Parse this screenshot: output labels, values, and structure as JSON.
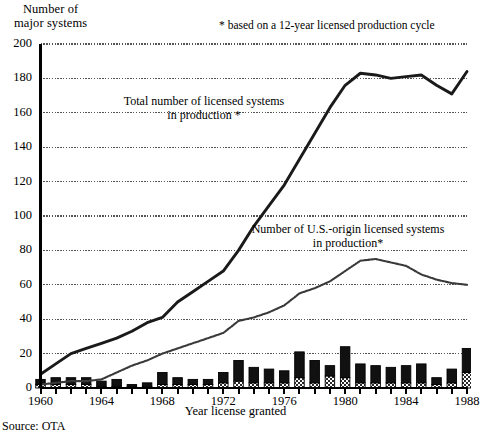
{
  "labels": {
    "y_axis_title": "Number of\nmajor systems",
    "x_axis_title": "Year license granted",
    "footnote": "* based on a 12-year licensed production cycle",
    "source": "Source: OTA",
    "annotation_total": "Total number of licensed systems\nin production *",
    "annotation_us": "Number of U.S.-origin licensed systems\nin production*"
  },
  "colors": {
    "axis": "#000000",
    "gridline": "#555555",
    "line_total": "#1a1a1a",
    "line_us": "#3a3a3a",
    "bar_top": "#111111",
    "bar_bottom_pattern": "#cccccc",
    "background": "#ffffff"
  },
  "chart_data": {
    "type": "line",
    "title": "",
    "xlabel": "Year license granted",
    "ylabel": "Number of major systems",
    "xlim": [
      1960,
      1988
    ],
    "ylim": [
      0,
      200
    ],
    "ytick_labels": [
      "0",
      "20",
      "40",
      "60",
      "80",
      "100",
      "120",
      "140",
      "160",
      "180",
      "200"
    ],
    "yticks": [
      0,
      20,
      40,
      60,
      80,
      100,
      120,
      140,
      160,
      180,
      200
    ],
    "xtick_labels": [
      "1960",
      "1964",
      "1968",
      "1972",
      "1976",
      "1980",
      "1984",
      "1988"
    ],
    "xticks": [
      1960,
      1964,
      1968,
      1972,
      1976,
      1980,
      1984,
      1988
    ],
    "grid": true,
    "legend_position": "inline-annotations",
    "x": [
      1960,
      1961,
      1962,
      1963,
      1964,
      1965,
      1966,
      1967,
      1968,
      1969,
      1970,
      1971,
      1972,
      1973,
      1974,
      1975,
      1976,
      1977,
      1978,
      1979,
      1980,
      1981,
      1982,
      1983,
      1984,
      1985,
      1986,
      1987,
      1988
    ],
    "series": [
      {
        "name": "Total number of licensed systems in production *",
        "style": "solid-thick",
        "values": [
          8,
          14,
          20,
          23,
          26,
          29,
          33,
          38,
          41,
          50,
          56,
          62,
          68,
          80,
          94,
          106,
          118,
          133,
          148,
          163,
          176,
          183,
          182,
          180,
          181,
          182,
          176,
          171,
          184
        ]
      },
      {
        "name": "Number of U.S.-origin licensed systems in production*",
        "style": "dotted-thin",
        "values": [
          2,
          3,
          4,
          4,
          5,
          9,
          13,
          16,
          20,
          23,
          26,
          29,
          32,
          39,
          41,
          44,
          48,
          55,
          58,
          62,
          68,
          74,
          75,
          73,
          71,
          66,
          63,
          61,
          60
        ]
      }
    ],
    "bars": {
      "name": "Licenses granted per year",
      "stacked": true,
      "segments": [
        {
          "name": "non-U.S.-origin licenses granted",
          "fill": "solid-black",
          "values": [
            3,
            4,
            4,
            4,
            3,
            4,
            1,
            2,
            7,
            4,
            3,
            3,
            6,
            12,
            9,
            8,
            7,
            15,
            13,
            6,
            18,
            11,
            10,
            9,
            10,
            11,
            4,
            8,
            14
          ]
        },
        {
          "name": "U.S.-origin licenses granted",
          "fill": "checkered",
          "values": [
            2,
            2,
            2,
            2,
            1,
            1,
            1,
            1,
            2,
            2,
            2,
            2,
            3,
            4,
            3,
            3,
            3,
            6,
            3,
            7,
            6,
            3,
            3,
            3,
            3,
            3,
            2,
            3,
            9
          ]
        }
      ],
      "totals": [
        5,
        6,
        6,
        6,
        4,
        5,
        2,
        3,
        9,
        6,
        5,
        5,
        9,
        16,
        12,
        11,
        10,
        21,
        16,
        13,
        24,
        14,
        13,
        12,
        13,
        14,
        6,
        11,
        23
      ]
    }
  }
}
